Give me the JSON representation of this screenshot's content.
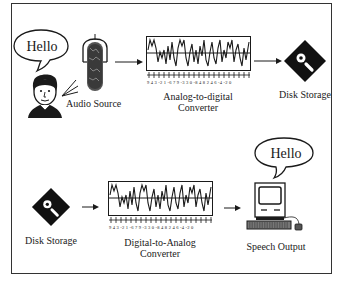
{
  "diagram": {
    "top_row": {
      "speech_bubble": {
        "text": "Hello"
      },
      "audio_source": {
        "label": "Audio Source"
      },
      "adc": {
        "label_line1": "Analog-to-digital",
        "label_line2": "Converter",
        "digits": "9 4 3 -2 1 -6 7 9 -3 3 0 -8 4 8 2 4 6 -4 -2 0"
      },
      "disk": {
        "label": "Disk Storage"
      }
    },
    "bottom_row": {
      "disk": {
        "label": "Disk Storage"
      },
      "dac": {
        "label_line1": "Digital-to-Analog",
        "label_line2": "Converter",
        "digits": "9 4 3 -2 1 -6 7 9 -3 3 0 -8 4 8 2 4 6 -4 -2 0"
      },
      "computer": {
        "label": "Speech Output"
      },
      "speech_bubble": {
        "text": "Hello"
      }
    },
    "colors": {
      "ink": "#1a1a1a",
      "frame": "#333333",
      "background": "#ffffff"
    }
  }
}
